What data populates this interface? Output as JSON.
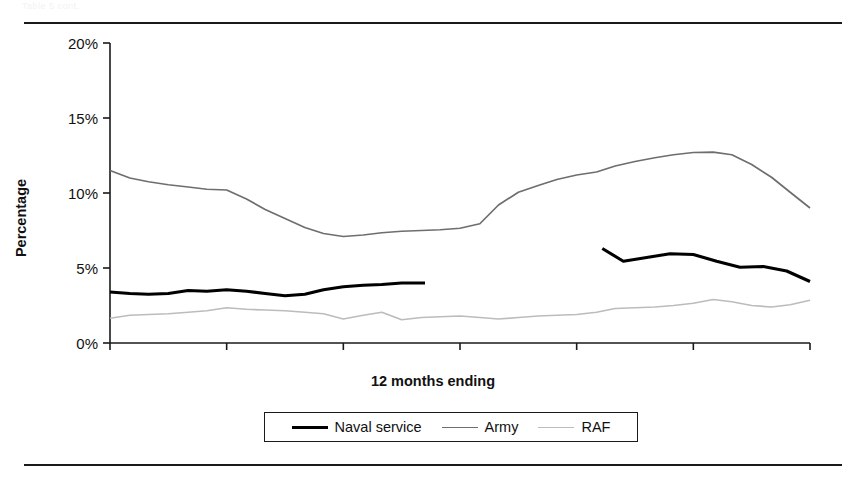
{
  "figure": {
    "ghost_header_text": "Table 5 cont.",
    "rules": [
      "top-rule",
      "bottom-rule"
    ]
  },
  "legend": {
    "position": "bottom-center",
    "entries": [
      {
        "label": "Naval service",
        "color": "#000000",
        "swatch": "thick-solid-line"
      },
      {
        "label": "Army",
        "color": "#6e6e6e",
        "swatch": "medium-solid-line"
      },
      {
        "label": "RAF",
        "color": "#bcbcbc",
        "swatch": "light-solid-line"
      }
    ]
  },
  "chart_data": {
    "type": "line",
    "title": "",
    "xlabel": "12 months ending",
    "ylabel": "Percentage",
    "ylim": [
      0,
      20
    ],
    "yticks": [
      0,
      5,
      10,
      15,
      20
    ],
    "ytick_labels": [
      "0%",
      "5%",
      "10%",
      "15%",
      "20%"
    ],
    "grid": false,
    "categories": [
      "31 Mar 04",
      "31 Mar 05",
      "31 Mar 06",
      "31 Mar 07",
      "31 Mar 08",
      "31 Mar 09",
      "31 Mar 10"
    ],
    "x_major_positions": [
      0,
      1,
      2,
      3,
      4,
      5,
      6
    ],
    "series": [
      {
        "name": "Naval service",
        "color": "#000000",
        "has_gap": true,
        "segments": [
          {
            "x": [
              0.0,
              0.17,
              0.33,
              0.5,
              0.67,
              0.83,
              1.0,
              1.17,
              1.33,
              1.5,
              1.67,
              1.83,
              2.0,
              2.17,
              2.33,
              2.5,
              2.7
            ],
            "y": [
              3.4,
              3.3,
              3.25,
              3.3,
              3.5,
              3.45,
              3.55,
              3.45,
              3.3,
              3.15,
              3.25,
              3.55,
              3.75,
              3.85,
              3.9,
              4.0,
              4.0
            ]
          },
          {
            "x": [
              4.22,
              4.4,
              4.6,
              4.8,
              5.0,
              5.2,
              5.4,
              5.6,
              5.8,
              6.0
            ],
            "y": [
              6.3,
              5.45,
              5.7,
              5.95,
              5.9,
              5.45,
              5.05,
              5.1,
              4.8,
              4.1
            ]
          }
        ]
      },
      {
        "name": "Army",
        "color": "#6e6e6e",
        "has_gap": false,
        "segments": [
          {
            "x": [
              0.0,
              0.17,
              0.33,
              0.5,
              0.67,
              0.83,
              1.0,
              1.17,
              1.33,
              1.5,
              1.67,
              1.83,
              2.0,
              2.17,
              2.33,
              2.5,
              2.67,
              2.83,
              3.0,
              3.17,
              3.33,
              3.5,
              3.67,
              3.83,
              4.0,
              4.17,
              4.33,
              4.5,
              4.67,
              4.83,
              5.0,
              5.17,
              5.33,
              5.5,
              5.67,
              5.83,
              6.0
            ],
            "y": [
              11.5,
              11.0,
              10.75,
              10.55,
              10.4,
              10.25,
              10.2,
              9.6,
              8.9,
              8.3,
              7.7,
              7.3,
              7.1,
              7.2,
              7.35,
              7.45,
              7.5,
              7.55,
              7.65,
              7.95,
              9.2,
              10.05,
              10.5,
              10.9,
              11.2,
              11.4,
              11.8,
              12.1,
              12.35,
              12.55,
              12.7,
              12.72,
              12.55,
              11.9,
              11.05,
              10.05,
              9.0
            ]
          }
        ]
      },
      {
        "name": "RAF",
        "color": "#bcbcbc",
        "has_gap": false,
        "segments": [
          {
            "x": [
              0.0,
              0.17,
              0.33,
              0.5,
              0.67,
              0.83,
              1.0,
              1.17,
              1.33,
              1.5,
              1.67,
              1.83,
              2.0,
              2.17,
              2.33,
              2.5,
              2.67,
              2.83,
              3.0,
              3.17,
              3.33,
              3.5,
              3.67,
              3.83,
              4.0,
              4.17,
              4.33,
              4.5,
              4.67,
              4.83,
              5.0,
              5.17,
              5.33,
              5.5,
              5.67,
              5.83,
              6.0
            ],
            "y": [
              1.65,
              1.85,
              1.9,
              1.95,
              2.05,
              2.15,
              2.35,
              2.25,
              2.2,
              2.15,
              2.05,
              1.95,
              1.6,
              1.85,
              2.05,
              1.55,
              1.7,
              1.75,
              1.8,
              1.7,
              1.6,
              1.7,
              1.8,
              1.85,
              1.9,
              2.05,
              2.3,
              2.35,
              2.4,
              2.5,
              2.65,
              2.9,
              2.75,
              2.5,
              2.4,
              2.55,
              2.85
            ]
          }
        ]
      }
    ]
  }
}
